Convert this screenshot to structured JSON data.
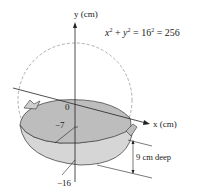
{
  "figure": {
    "y_axis_label": "y (cm)",
    "x_axis_label": "x (cm)",
    "equation": {
      "lhs_x": "x",
      "plus": " + ",
      "lhs_y": "y",
      "eq1": " = 16",
      "eq2": " = 256",
      "exp": "2"
    },
    "ticks": {
      "zero": "0",
      "minus7": "−7",
      "minus16": "−16"
    },
    "depth_label": "9 cm deep"
  },
  "colors": {
    "wok_inner": "#bdbdbd",
    "wok_outer": "#d6d6d6",
    "circle_dash": "#9a9a9a",
    "axis": "#222222"
  }
}
